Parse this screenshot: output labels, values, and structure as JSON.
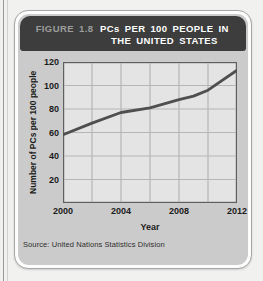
{
  "figure": {
    "label": "FIGURE 1.8",
    "title": "PCs PER 100 PEOPLE IN THE UNITED STATES",
    "source": "Source: United Nations Statistics Division"
  },
  "chart_data": {
    "type": "line",
    "title": "PCs per 100 People in the United States",
    "xlabel": "Year",
    "ylabel": "Number of PCs per 100 people",
    "xlim": [
      2000,
      2012
    ],
    "ylim": [
      0,
      120
    ],
    "x_tick_labels": [
      2000,
      2004,
      2008,
      2012
    ],
    "x_grid_step": 2,
    "y_tick_step": 20,
    "grid": true,
    "legend": false,
    "series": [
      {
        "name": "PCs per 100 people",
        "x": [
          2000,
          2002,
          2004,
          2006,
          2008,
          2009,
          2010,
          2012
        ],
        "y": [
          58,
          68,
          77,
          81,
          88,
          91,
          96,
          113
        ]
      }
    ]
  },
  "colors": {
    "page_bg": "#f1f1ef",
    "card_bg": "#cbcbcb",
    "header_bg": "#3d3d3d",
    "header_label": "#9c9c9c",
    "header_title": "#ffffff",
    "plot_bg": "#e4e4e4",
    "plot_border": "#5f5f5f",
    "grid": "#b6b6b6",
    "line": "#4f4f4f"
  }
}
